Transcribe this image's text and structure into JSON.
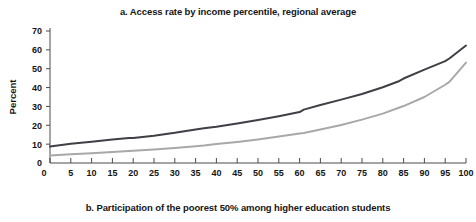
{
  "figure": {
    "panel_title": "a. Access rate by income percentile, regional average",
    "panel_caption": "b. Participation of the poorest 50% among higher education students"
  },
  "chart_data": {
    "type": "line",
    "title": "a. Access rate by income percentile, regional average",
    "subtitle": "b. Participation of the poorest 50% among higher education students",
    "xlabel": "Income percentile",
    "ylabel": "Percent",
    "xlim": [
      0,
      100
    ],
    "ylim": [
      0,
      70
    ],
    "grid": false,
    "legend": "none",
    "xticks": [
      0,
      5,
      10,
      15,
      20,
      25,
      30,
      35,
      40,
      45,
      50,
      55,
      60,
      65,
      70,
      75,
      80,
      85,
      90,
      95,
      100
    ],
    "xtick_labels": [
      "0",
      "5",
      "10",
      "15",
      "20",
      "25",
      "30",
      "35",
      "40",
      "45",
      "50",
      "55",
      "60",
      "65",
      "70",
      "75",
      "80",
      "85",
      "90",
      "95",
      "100"
    ],
    "yticks": [
      0,
      10,
      20,
      30,
      40,
      50,
      60,
      70
    ],
    "ytick_labels": [
      "0",
      "10",
      "20",
      "30",
      "40",
      "50",
      "60",
      "70"
    ],
    "x": [
      0,
      5,
      10,
      15,
      19,
      20,
      25,
      30,
      35,
      37,
      40,
      45,
      50,
      55,
      60,
      61,
      65,
      70,
      75,
      80,
      84,
      85,
      90,
      95,
      96,
      100
    ],
    "series": [
      {
        "name": "upper-curve",
        "color": "#3f3f46",
        "width": 2.0,
        "values": [
          8.7,
          10.2,
          11.3,
          12.4,
          13.3,
          13.3,
          14.5,
          16.0,
          17.8,
          18.4,
          19.2,
          21.0,
          22.8,
          24.8,
          27.0,
          28.3,
          30.8,
          33.6,
          36.6,
          40.2,
          43.5,
          44.8,
          49.5,
          54.0,
          55.4,
          62.3
        ]
      },
      {
        "name": "lower-curve",
        "color": "#a8a8a8",
        "width": 2.0,
        "values": [
          4.0,
          4.6,
          5.2,
          5.8,
          6.4,
          6.5,
          7.2,
          8.0,
          8.9,
          9.3,
          10.1,
          11.2,
          12.5,
          14.0,
          15.7,
          15.9,
          17.8,
          20.2,
          23.0,
          26.2,
          29.4,
          30.2,
          35.0,
          41.5,
          43.0,
          53.2
        ]
      }
    ]
  }
}
